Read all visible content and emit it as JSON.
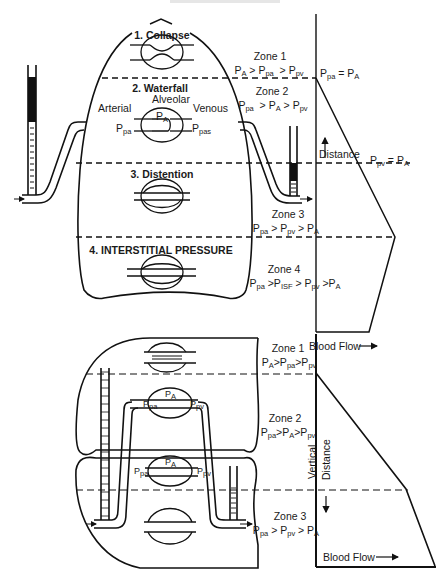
{
  "top_caption": "",
  "upper_diagram": {
    "section_titles": [
      {
        "id": "collapse",
        "text": "1. Collapse"
      },
      {
        "id": "waterfall",
        "text": "2. Waterfall"
      },
      {
        "id": "distention",
        "text": "3. Distention"
      },
      {
        "id": "interstitial",
        "text": "4. INTERSTITIAL PRESSURE"
      }
    ],
    "vessel_labels": {
      "arterial": "Arterial",
      "alveolar": "Alveolar",
      "venous": "Venous",
      "ppa": "P",
      "ppa_sub": "pa",
      "pA": "P",
      "pA_sub": "A",
      "ppas": "P",
      "ppas_sub": "pas"
    },
    "zones": [
      {
        "title": "Zone 1",
        "formula": [
          [
            "P",
            "A"
          ],
          [
            " > ",
            ""
          ],
          [
            "P",
            "pa"
          ],
          [
            "  > ",
            ""
          ],
          [
            "P",
            "pv"
          ]
        ]
      },
      {
        "title": "Zone 2",
        "formula": [
          [
            "P",
            "pa"
          ],
          [
            "  > ",
            ""
          ],
          [
            "P",
            "A"
          ],
          [
            " > ",
            ""
          ],
          [
            "P",
            "pv"
          ]
        ]
      },
      {
        "title": "Zone 3",
        "formula": [
          [
            "P",
            "pa"
          ],
          [
            " > ",
            ""
          ],
          [
            "P",
            "pv"
          ],
          [
            " > ",
            ""
          ],
          [
            "P",
            "A"
          ]
        ]
      },
      {
        "title": "Zone 4",
        "formula": [
          [
            "P",
            "pa"
          ],
          [
            " >",
            ""
          ],
          [
            "P",
            "ISF"
          ],
          [
            " > ",
            ""
          ],
          [
            "P",
            "pv"
          ],
          [
            " >",
            ""
          ],
          [
            "P",
            "A"
          ]
        ]
      }
    ],
    "graph": {
      "boundary_label_1": [
        [
          "P",
          "pa"
        ],
        [
          " = ",
          ""
        ],
        [
          "P",
          "A"
        ]
      ],
      "boundary_label_2": [
        [
          "P",
          "pv"
        ],
        [
          " = ",
          ""
        ],
        [
          "P",
          "A"
        ]
      ],
      "y_axis_label": "Distance",
      "x_axis_label": "Blood Flow",
      "arrow": "→"
    }
  },
  "lower_diagram": {
    "vessel_labels": {
      "pA": "P",
      "pA_sub": "A",
      "ppa": "P",
      "ppa_sub": "pa",
      "ppv": "P",
      "ppv_sub": "pv"
    },
    "zones": [
      {
        "title": "Zone 1",
        "formula": [
          [
            "P",
            "A"
          ],
          [
            ">",
            ""
          ],
          [
            "P",
            "pa"
          ],
          [
            ">",
            ""
          ],
          [
            "P",
            "pv"
          ]
        ]
      },
      {
        "title": "Zone 2",
        "formula": [
          [
            "P",
            "pa"
          ],
          [
            ">",
            ""
          ],
          [
            "P",
            "A"
          ],
          [
            ">",
            ""
          ],
          [
            "P",
            "pv"
          ]
        ]
      },
      {
        "title": "Zone 3",
        "formula": [
          [
            "P",
            "pa"
          ],
          [
            " > ",
            ""
          ],
          [
            "P",
            "pv"
          ],
          [
            " > ",
            ""
          ],
          [
            "P",
            "A"
          ]
        ]
      }
    ],
    "graph": {
      "y_axis_label_1": "Vertical",
      "y_axis_label_2": "Distance",
      "x_axis_label": "Blood Flow",
      "arrow": "⟶"
    }
  },
  "colors": {
    "ink": "#111111",
    "background": "#ffffff"
  }
}
